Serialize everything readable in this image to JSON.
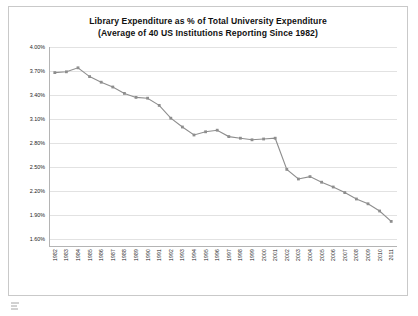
{
  "chart_data": {
    "type": "line",
    "title": "Library Expenditure as % of Total University Expenditure",
    "subtitle": "(Average of 40 US Institutions Reporting Since 1982)",
    "xlabel": "",
    "ylabel": "",
    "grid": true,
    "legend": false,
    "ylim": [
      1.5,
      4.0
    ],
    "ytick_labels": [
      "4.00%",
      "3.70%",
      "3.40%",
      "3.10%",
      "2.80%",
      "2.50%",
      "2.20%",
      "1.90%",
      "1.60%"
    ],
    "ytick_values": [
      4.0,
      3.7,
      3.4,
      3.1,
      2.8,
      2.5,
      2.2,
      1.9,
      1.6
    ],
    "categories": [
      "1982",
      "1983",
      "1984",
      "1985",
      "1986",
      "1987",
      "1988",
      "1989",
      "1990",
      "1991",
      "1992",
      "1993",
      "1994",
      "1995",
      "1996",
      "1997",
      "1998",
      "1999",
      "2000",
      "2001",
      "2002",
      "2003",
      "2004",
      "2005",
      "2006",
      "2007",
      "2008",
      "2009",
      "2010",
      "2011"
    ],
    "values": [
      3.68,
      3.69,
      3.74,
      3.63,
      3.56,
      3.5,
      3.42,
      3.37,
      3.36,
      3.27,
      3.11,
      3.0,
      2.9,
      2.94,
      2.96,
      2.88,
      2.86,
      2.84,
      2.85,
      2.86,
      2.47,
      2.35,
      2.38,
      2.31,
      2.25,
      2.18,
      2.1,
      2.04,
      1.95,
      1.82
    ],
    "series_color": "#8e8e8e",
    "marker_color": "#8e8e8e",
    "grid_color": "#e2e2e2",
    "axis_color": "#b4b4b4"
  }
}
